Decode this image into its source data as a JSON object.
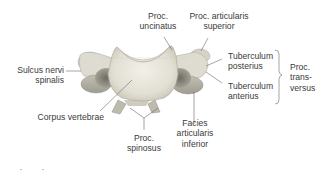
{
  "figure": {
    "colors": {
      "bone_light": "#e9e7de",
      "bone_mid": "#cfccbf",
      "bone_shadow": "#8f8c82",
      "leader_line": "#6a6a6a",
      "text": "#3a3a3a"
    }
  },
  "labels": {
    "proc_uncinatus": [
      "Proc.",
      "uncinatus"
    ],
    "proc_articularis_superior": [
      "Proc. articularis",
      "superior"
    ],
    "sulcus_nervi_spinalis": [
      "Sulcus nervi",
      "spinalis"
    ],
    "tuberculum_posterius": [
      "Tuberculum",
      "posterius"
    ],
    "tuberculum_anterius": [
      "Tuberculum",
      "anterius"
    ],
    "proc_transversus": [
      "Proc.",
      "trans-",
      "versus"
    ],
    "corpus_vertebrae": [
      "Corpus vertebrae"
    ],
    "facies_articularis_inferior": [
      "Facies",
      "articularis",
      "inferior"
    ],
    "proc_spinosus": [
      "Proc.",
      "spinosus"
    ]
  }
}
